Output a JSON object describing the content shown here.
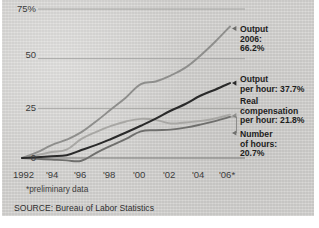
{
  "figure": {
    "background_color": "#d5d4d2",
    "footnote": "*preliminary data",
    "source": "SOURCE: Bureau of Labor Statistics"
  },
  "axes": {
    "y_ticks": [
      "75%",
      "50",
      "25",
      "0"
    ],
    "x_ticks": [
      "1992",
      "'94",
      "'96",
      "'98",
      "'00",
      "'02",
      "'04",
      "'06*"
    ]
  },
  "legend": {
    "output": {
      "line1": "Output",
      "line2": "2006:",
      "line3": "66.2%",
      "color": "#8e8e8c"
    },
    "output_per_hour": {
      "line1": "Output",
      "line2": "per hour: 37.7%",
      "color": "#2a2a2a"
    },
    "real_compensation": {
      "line1": "Real",
      "line2": "compensation",
      "line3": "per hour: 21.8%",
      "color": "#a8a7a4"
    },
    "number_of_hours": {
      "line1": "Number",
      "line2": "of hours:",
      "line3": "20.7%",
      "color": "#6f6f6d"
    }
  },
  "chart_data": {
    "type": "line",
    "title": "",
    "xlabel": "",
    "ylabel": "",
    "xlim": [
      1992,
      2006
    ],
    "ylim": [
      0,
      75
    ],
    "grid": "horizontal",
    "legend_position": "right-inline",
    "x": [
      1992,
      1993,
      1994,
      1995,
      1996,
      1997,
      1998,
      1999,
      2000,
      2001,
      2002,
      2003,
      2004,
      2005,
      2006
    ],
    "series": [
      {
        "name": "Output",
        "label": "Output 2006: 66.2%",
        "final_value": 66.2,
        "color": "#8e8e8c",
        "values": [
          0,
          2.8,
          6.5,
          9.2,
          13.0,
          18.5,
          24.5,
          30.5,
          37.2,
          38.5,
          41.5,
          45.5,
          51.5,
          58.5,
          66.2
        ]
      },
      {
        "name": "Output per hour",
        "label": "Output per hour: 37.7%",
        "final_value": 37.7,
        "color": "#2a2a2a",
        "values": [
          0,
          0.4,
          0.9,
          1.4,
          4.0,
          6.6,
          9.6,
          12.8,
          16.2,
          19.8,
          23.8,
          27.2,
          31.3,
          34.4,
          37.7
        ]
      },
      {
        "name": "Real compensation per hour",
        "label": "Real compensation per hour: 21.8%",
        "final_value": 21.8,
        "color": "#a8a7a4",
        "values": [
          0,
          1.4,
          3.0,
          4.2,
          9.6,
          13.2,
          16.2,
          18.4,
          19.7,
          19.2,
          17.4,
          17.9,
          18.6,
          19.9,
          21.8
        ]
      },
      {
        "name": "Number of hours",
        "label": "Number of hours: 20.7%",
        "final_value": 20.7,
        "color": "#6f6f6d",
        "values": [
          0,
          -0.4,
          -0.8,
          -1.2,
          -1.4,
          2.6,
          6.2,
          9.6,
          13.4,
          14.0,
          14.3,
          15.3,
          16.8,
          18.6,
          20.7
        ]
      }
    ]
  }
}
